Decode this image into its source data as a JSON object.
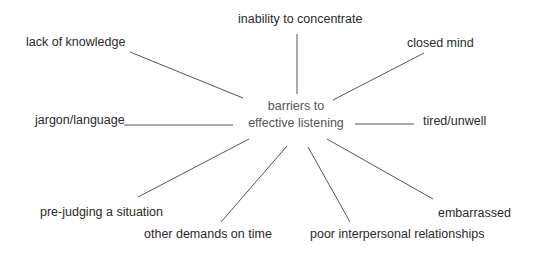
{
  "diagram": {
    "type": "spider-diagram",
    "center": {
      "line1": "barriers to",
      "line2": "effective listening"
    },
    "branches": [
      {
        "label": "inability to concentrate",
        "position": "top"
      },
      {
        "label": "lack of knowledge",
        "position": "top-left"
      },
      {
        "label": "closed mind",
        "position": "top-right"
      },
      {
        "label": "jargon/language",
        "position": "left"
      },
      {
        "label": "tired/unwell",
        "position": "right"
      },
      {
        "label": "pre-judging a situation",
        "position": "bottom-left"
      },
      {
        "label": "other demands on time",
        "position": "bottom"
      },
      {
        "label": "poor interpersonal relationships",
        "position": "bottom"
      },
      {
        "label": "embarrassed",
        "position": "bottom-right"
      }
    ],
    "colors": {
      "line": "#555555",
      "label_text": "#2a2a2a",
      "center_text": "#555555",
      "background": "#ffffff"
    }
  }
}
